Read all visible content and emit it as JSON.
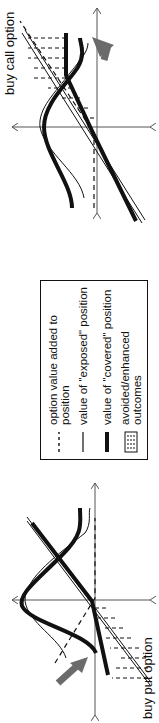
{
  "panels": {
    "put": {
      "title": "buy put option"
    },
    "call": {
      "title": "buy call option"
    }
  },
  "legend": {
    "items": [
      {
        "symbol": "dashed-line",
        "label": "option value added to position"
      },
      {
        "symbol": "thin-line",
        "label": "value of \"exposed\" position"
      },
      {
        "symbol": "thick-line",
        "label": "value of \"covered\" position"
      },
      {
        "symbol": "hatched-box",
        "label": "avoided/enhanced outcomes"
      }
    ]
  },
  "colors": {
    "ink": "#111111",
    "arrow": "#6b6b6b",
    "axis": "#555555"
  }
}
